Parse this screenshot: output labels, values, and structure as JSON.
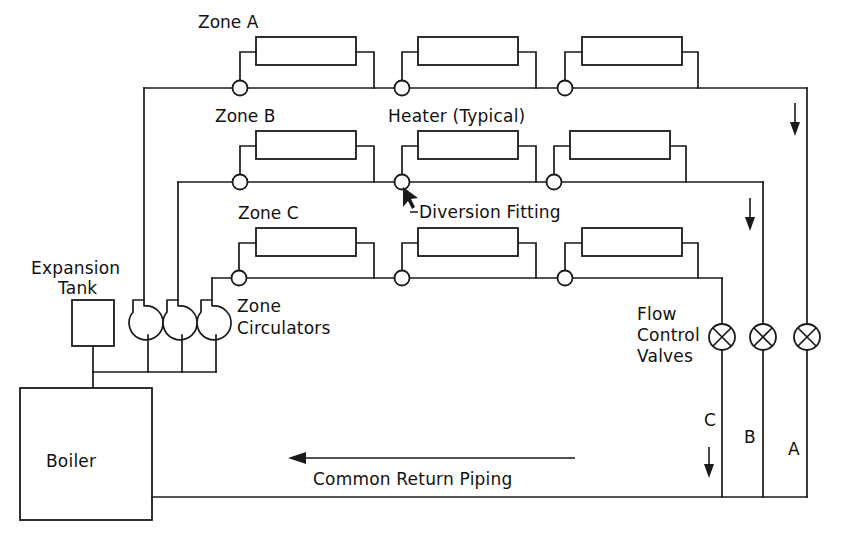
{
  "diagram": {
    "line_color": "#1a1a1a",
    "background": "#ffffff",
    "labels": {
      "zone_a": "Zone A",
      "zone_b": "Zone B",
      "zone_c": "Zone C",
      "heater_typical": "Heater (Typical)",
      "diversion_fitting": "Diversion Fitting",
      "expansion_line1": "Expansion",
      "expansion_line2": "Tank",
      "zone_circulators_line1": "Zone",
      "zone_circulators_line2": "Circulators",
      "boiler": "Boiler",
      "flow_control_line1": "Flow",
      "flow_control_line2": "Control",
      "flow_control_line3": "Valves",
      "common_return": "Common Return Piping",
      "riser_c": "C",
      "riser_b": "B",
      "riser_a": "A"
    },
    "components": {
      "heaters_per_zone": 3,
      "zones": [
        "Zone A",
        "Zone B",
        "Zone C"
      ],
      "circulator_count": 3,
      "flow_control_valve_count": 3,
      "flow_control_valve_tags": [
        "C",
        "B",
        "A"
      ],
      "diversion_tee_count_per_zone": 3,
      "expansion_tank_count": 1,
      "boiler_count": 1
    },
    "flow_arrows": [
      {
        "name": "zone-a-return-arrow",
        "tag": "A",
        "direction": "down"
      },
      {
        "name": "zone-b-return-arrow",
        "tag": "B",
        "direction": "down"
      },
      {
        "name": "zone-c-return-arrow",
        "tag": "C",
        "direction": "down"
      },
      {
        "name": "common-return-arrow",
        "tag": "Common Return Piping",
        "direction": "left"
      }
    ]
  }
}
